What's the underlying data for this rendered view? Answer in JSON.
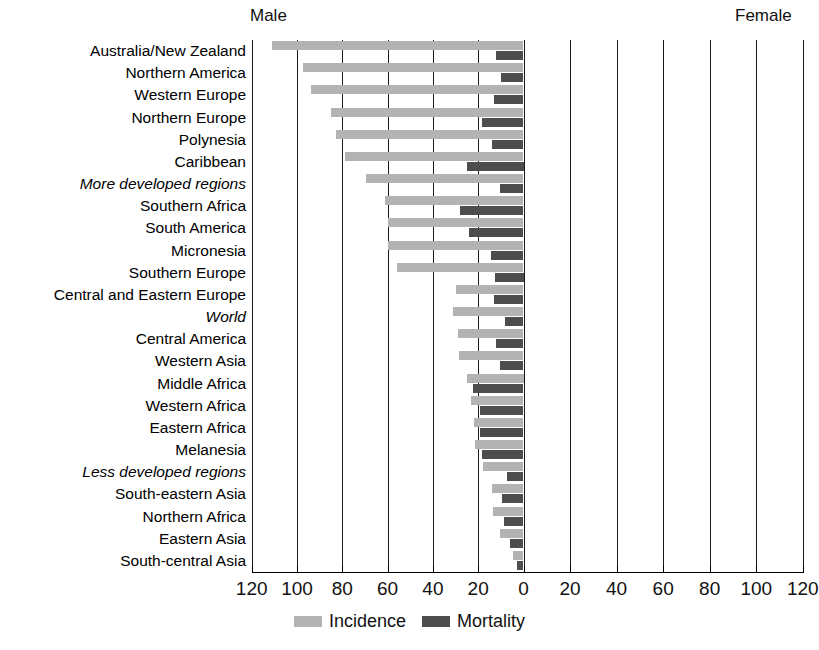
{
  "headers": {
    "male": "Male",
    "female": "Female"
  },
  "axis": {
    "ticks_male": [
      120,
      100,
      80,
      60,
      40,
      20,
      0
    ],
    "ticks_female": [
      0,
      20,
      40,
      60,
      80,
      100,
      120
    ],
    "max": 120,
    "step": 20
  },
  "legend": {
    "items": [
      {
        "label": "Incidence",
        "color": "#b3b3b3",
        "key": "incidence"
      },
      {
        "label": "Mortality",
        "color": "#4d4d4d",
        "key": "mortality"
      }
    ]
  },
  "caption": {
    "text": ""
  },
  "chart_data": {
    "type": "bar",
    "orientation": "horizontal-diverging",
    "title": "",
    "subtitle": "",
    "xlabel": "",
    "ylabel": "",
    "xlim": [
      -120,
      120
    ],
    "grid": true,
    "legend_position": "bottom-center",
    "panels": [
      "Male",
      "Female"
    ],
    "note": "Estimated age-standardised rates per 100,000. Male values are drawn leftwards from zero; the Female panel is empty in this figure.",
    "categories": [
      "Australia/New Zealand",
      "Northern America",
      "Western Europe",
      "Northern Europe",
      "Polynesia",
      "Caribbean",
      "More developed regions",
      "Southern Africa",
      "South America",
      "Micronesia",
      "Southern Europe",
      "Central and Eastern Europe",
      "World",
      "Central America",
      "Western Asia",
      "Middle Africa",
      "Western Africa",
      "Eastern Africa",
      "Melanesia",
      "Less developed regions",
      "South-eastern Asia",
      "Northern Africa",
      "Eastern Asia",
      "South-central Asia"
    ],
    "italic_categories": [
      "More developed regions",
      "World",
      "Less developed regions"
    ],
    "series": [
      {
        "name": "Incidence",
        "side": "Male",
        "color": "#b3b3b3",
        "values": [
          111.0,
          97.2,
          94.0,
          85.0,
          83.0,
          79.0,
          69.5,
          61.0,
          60.0,
          60.0,
          56.0,
          30.0,
          31.0,
          29.0,
          28.5,
          25.0,
          23.0,
          22.0,
          21.5,
          18.0,
          14.0,
          13.5,
          10.5,
          4.5
        ]
      },
      {
        "name": "Mortality",
        "side": "Male",
        "color": "#4d4d4d",
        "values": [
          12.0,
          10.0,
          13.0,
          18.5,
          14.0,
          25.0,
          10.5,
          28.0,
          24.0,
          14.5,
          12.5,
          13.0,
          8.0,
          12.0,
          10.5,
          22.5,
          19.0,
          19.0,
          18.5,
          7.5,
          9.5,
          8.5,
          6.0,
          3.0
        ]
      }
    ],
    "female_values": {
      "Incidence": [],
      "Mortality": []
    }
  }
}
